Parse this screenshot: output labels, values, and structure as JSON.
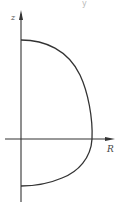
{
  "diagram": {
    "type": "curve-on-axes",
    "axes": {
      "vertical_label": "z",
      "horizontal_label": "R"
    },
    "top_fragment": "y",
    "colors": {
      "stroke": "#333333",
      "background": "#ffffff",
      "label": "#444444"
    },
    "curve": {
      "description": "Closed-on-axis profile: starts on the z-axis above the origin, bulges to the right reaching its maximum R on the R-axis, and returns to the z-axis below the origin",
      "start": {
        "x": 21,
        "y": 40
      },
      "max_R_point": {
        "x": 92,
        "y": 139
      },
      "end": {
        "x": 21,
        "y": 186
      }
    }
  }
}
